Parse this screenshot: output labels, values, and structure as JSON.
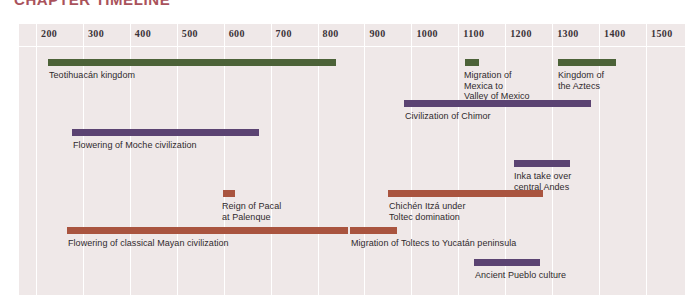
{
  "title": "CHAPTER TIMELINE",
  "colors": {
    "title": "#9e3b46",
    "panel_background": "#efe8e8",
    "gridline": "#ffffff",
    "green": "#4c6238",
    "purple": "#5b4372",
    "red": "#a9543f",
    "tick_text": "#3b3338",
    "label_text": "#2f2a2d"
  },
  "chart_data": {
    "type": "bar",
    "orientation": "horizontal-timeline",
    "title": "CHAPTER TIMELINE",
    "xlabel": "",
    "ylabel": "",
    "xlim": [
      150,
      1550
    ],
    "grid": true,
    "legend": null,
    "axis_ticks": [
      "200",
      "300",
      "400",
      "500",
      "600",
      "700",
      "800",
      "900",
      "1000",
      "1100",
      "1200",
      "1300",
      "1400",
      "1500"
    ],
    "axis_tick_values": [
      200,
      300,
      400,
      500,
      600,
      700,
      800,
      900,
      1000,
      1100,
      1200,
      1300,
      1400,
      1500
    ],
    "categories": [
      "Teotihuacán kingdom",
      "Migration of Mexica to Valley of Mexico",
      "Kingdom of the Aztecs",
      "Civilization of Chimor",
      "Flowering of Moche civilization",
      "Inka take over central Andes",
      "Reign of Pacal at Palenque",
      "Chichén Itzá under Toltec domination",
      "Flowering of classical Mayan civilization",
      "Migration of Toltecs to Yucatán peninsula",
      "Ancient Pueblo culture"
    ],
    "series": [
      {
        "name": "Mesoamerica (green)",
        "color": "#4c6238",
        "events": [
          {
            "label": "Teotihuacán kingdom",
            "start": 175,
            "end": 790
          },
          {
            "label": "Migration of Mexica to\nValley of Mexico",
            "start": 1090,
            "end": 1125
          },
          {
            "label": "Kingdom of the Aztecs",
            "start": 1300,
            "end": 1425
          }
        ]
      },
      {
        "name": "Andes (purple)",
        "color": "#5b4372",
        "events": [
          {
            "label": "Civilization of Chimor",
            "start": 1000,
            "end": 1400
          },
          {
            "label": "Flowering of Moche civilization",
            "start": 300,
            "end": 700
          },
          {
            "label": "Inka take over\ncentral Andes",
            "start": 1320,
            "end": 1440
          },
          {
            "label": "Ancient Pueblo culture",
            "start": 1190,
            "end": 1330
          }
        ]
      },
      {
        "name": "Maya / Toltec (red)",
        "color": "#a9543f",
        "events": [
          {
            "label": "Reign of Pacal\nat Palenque",
            "start": 615,
            "end": 680
          },
          {
            "label": "Chichén Itzá under\nToltec domination",
            "start": 960,
            "end": 1290
          },
          {
            "label": "Flowering of classical Mayan civilization",
            "start": 250,
            "end": 900
          },
          {
            "label": "Migration of Toltecs to Yucatán peninsula",
            "start": 900,
            "end": 1000
          }
        ]
      }
    ],
    "rows": [
      {
        "label": "Teotihuacán kingdom",
        "color": "#4c6238",
        "start": 175,
        "end": 790,
        "bar_x": 30,
        "bar_w": 288,
        "bar_y": 35,
        "label_x": 31,
        "label_y": 46,
        "label_lines": 1
      },
      {
        "label": "Migration of\nMexica to\nValley of Mexico",
        "color": "#4c6238",
        "start": 1090,
        "end": 1125,
        "bar_x": 447,
        "bar_w": 14,
        "bar_y": 35,
        "label_x": 446,
        "label_y": 46,
        "label_lines": 3
      },
      {
        "label": "Kingdom of\nthe Aztecs",
        "color": "#4c6238",
        "start": 1300,
        "end": 1425,
        "bar_x": 540,
        "bar_w": 58,
        "bar_y": 35,
        "label_x": 540,
        "label_y": 46,
        "label_lines": 2
      },
      {
        "label": "Civilization of Chimor",
        "color": "#5b4372",
        "start": 1000,
        "end": 1400,
        "bar_x": 386,
        "bar_w": 187,
        "bar_y": 76,
        "label_x": 387,
        "label_y": 87,
        "label_lines": 1
      },
      {
        "label": "Flowering of Moche civilization",
        "color": "#5b4372",
        "start": 300,
        "end": 700,
        "bar_x": 54,
        "bar_w": 187,
        "bar_y": 105,
        "label_x": 55,
        "label_y": 116,
        "label_lines": 1
      },
      {
        "label": "Inka take over\ncentral Andes",
        "color": "#5b4372",
        "start": 1320,
        "end": 1440,
        "bar_x": 496,
        "bar_w": 56,
        "bar_y": 136,
        "label_x": 496,
        "label_y": 147,
        "label_lines": 2
      },
      {
        "label": "Reign of Pacal\nat Palenque",
        "color": "#a9543f",
        "start": 615,
        "end": 680,
        "bar_x": 205,
        "bar_w": 12,
        "bar_y": 166,
        "label_x": 204,
        "label_y": 177,
        "label_lines": 2
      },
      {
        "label": "Chichén Itzá under\nToltec domination",
        "color": "#a9543f",
        "start": 960,
        "end": 1290,
        "bar_x": 370,
        "bar_w": 155,
        "bar_y": 166,
        "label_x": 371,
        "label_y": 177,
        "label_lines": 2
      },
      {
        "label": "Flowering of classical Mayan civilization",
        "color": "#a9543f",
        "start": 250,
        "end": 900,
        "bar_x": 49,
        "bar_w": 281,
        "bar_y": 203,
        "label_x": 50,
        "label_y": 214,
        "label_lines": 1
      },
      {
        "label": "Migration of Toltecs to Yucatán peninsula",
        "color": "#a9543f",
        "start": 900,
        "end": 1000,
        "bar_x": 332,
        "bar_w": 47,
        "bar_y": 203,
        "label_x": 333,
        "label_y": 214,
        "label_lines": 1
      },
      {
        "label": "Ancient Pueblo culture",
        "color": "#5b4372",
        "start": 1190,
        "end": 1330,
        "bar_x": 456,
        "bar_w": 66,
        "bar_y": 235,
        "label_x": 457,
        "label_y": 246,
        "label_lines": 1
      }
    ]
  }
}
